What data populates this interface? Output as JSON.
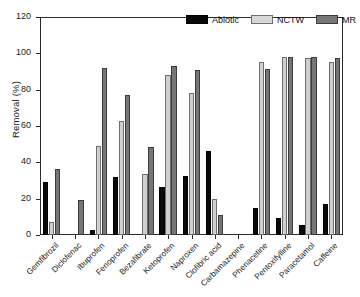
{
  "chart_data": {
    "type": "bar",
    "title": "",
    "xlabel": "",
    "ylabel": "Removal (%)",
    "ylim": [
      0,
      120
    ],
    "yticks": [
      0,
      20,
      40,
      60,
      80,
      100,
      120
    ],
    "grid": false,
    "legend_position": "top-right",
    "categories": [
      "Gemfibrozil",
      "Diclofenac",
      "Ibuprofen",
      "Fenoprofen",
      "Bezafibrate",
      "Ketoprofen",
      "Naproxen",
      "Clofibric acid",
      "Carbamazepine",
      "Phenacetine",
      "Pentoxifylline",
      "Paracetamol",
      "Caffeine"
    ],
    "series": [
      {
        "name": "Abiotic",
        "color": "#090909",
        "values": [
          29,
          0,
          2.5,
          32,
          0,
          26.5,
          32.5,
          46,
          0,
          15,
          9.5,
          5.5,
          17
        ]
      },
      {
        "name": "NCTW",
        "color": "#cfcfcf",
        "values": [
          7,
          0,
          49,
          62.5,
          33.5,
          88,
          78,
          20,
          0,
          95.5,
          98,
          97.5,
          95.5
        ]
      },
      {
        "name": "MR",
        "color": "#767676",
        "values": [
          36.5,
          19.5,
          92,
          77,
          48.5,
          93,
          91,
          11,
          0,
          91.5,
          98,
          98,
          97.5
        ]
      }
    ]
  },
  "legend": {
    "items": [
      {
        "label": "Abiotic",
        "swatch": "abiotic"
      },
      {
        "label": "NCTW",
        "swatch": "nctw"
      },
      {
        "label": "MR",
        "swatch": "mr"
      }
    ]
  },
  "axis": {
    "y_title": "Removal (%)",
    "y_tick_labels": [
      "0",
      "20",
      "40",
      "60",
      "80",
      "100",
      "120"
    ]
  }
}
